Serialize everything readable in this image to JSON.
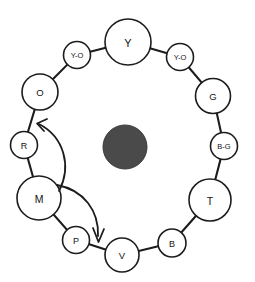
{
  "diagram": {
    "canvas": {
      "width": 255,
      "height": 282
    },
    "colors": {
      "stroke": "#1c1c1c",
      "node_fill": "#ffffff",
      "hub_fill": "#4a4a4a",
      "background": "#ffffff"
    },
    "hub": {
      "label": "",
      "cx": 125,
      "cy": 147,
      "r": 22
    },
    "nodes": [
      {
        "id": "y",
        "label": "Y",
        "cx": 128,
        "cy": 42,
        "r": 23,
        "font_size": 11
      },
      {
        "id": "yo-l",
        "label": "Y-O",
        "cx": 77,
        "cy": 55,
        "r": 13.5,
        "font_size": 7.5
      },
      {
        "id": "yo-r",
        "label": "Y-O",
        "cx": 180,
        "cy": 57,
        "r": 13.5,
        "font_size": 7.5
      },
      {
        "id": "o",
        "label": "O",
        "cx": 40,
        "cy": 92,
        "r": 18,
        "font_size": 9.5
      },
      {
        "id": "g",
        "label": "G",
        "cx": 213,
        "cy": 96,
        "r": 17.5,
        "font_size": 9.5
      },
      {
        "id": "r",
        "label": "R",
        "cx": 24,
        "cy": 145,
        "r": 13.5,
        "font_size": 9
      },
      {
        "id": "bg",
        "label": "B-G",
        "cx": 224,
        "cy": 146,
        "r": 13.5,
        "font_size": 7.5
      },
      {
        "id": "m",
        "label": "M",
        "cx": 39,
        "cy": 198,
        "r": 22,
        "font_size": 10.5
      },
      {
        "id": "t",
        "label": "T",
        "cx": 210,
        "cy": 200,
        "r": 21,
        "font_size": 10.5
      },
      {
        "id": "p",
        "label": "P",
        "cx": 76,
        "cy": 240,
        "r": 13.5,
        "font_size": 9
      },
      {
        "id": "b",
        "label": "B",
        "cx": 172,
        "cy": 243,
        "r": 14,
        "font_size": 9
      },
      {
        "id": "v",
        "label": "V",
        "cx": 122,
        "cy": 255,
        "r": 17,
        "font_size": 9.5
      }
    ],
    "links": [
      {
        "from": "y",
        "to": "yo-l"
      },
      {
        "from": "yo-l",
        "to": "o"
      },
      {
        "from": "o",
        "to": "r"
      },
      {
        "from": "r",
        "to": "m"
      },
      {
        "from": "m",
        "to": "p"
      },
      {
        "from": "p",
        "to": "v"
      },
      {
        "from": "v",
        "to": "b"
      },
      {
        "from": "b",
        "to": "t"
      },
      {
        "from": "t",
        "to": "bg"
      },
      {
        "from": "bg",
        "to": "g"
      },
      {
        "from": "g",
        "to": "yo-r"
      },
      {
        "from": "yo-r",
        "to": "y"
      }
    ],
    "arrows": [
      {
        "id": "arrow-m-to-r",
        "path": "M 59 191 C 72 166 64 137 39 124",
        "head": "M 47 119 L 37 123.5 L 44 131",
        "direction": "counterclockwise-up"
      },
      {
        "id": "arrow-m-to-v",
        "path": "M 57 185 C 84 190 99 211 98 236",
        "head": "M 93 228 L 98.5 242 L 104 229",
        "direction": "clockwise-down"
      }
    ]
  }
}
